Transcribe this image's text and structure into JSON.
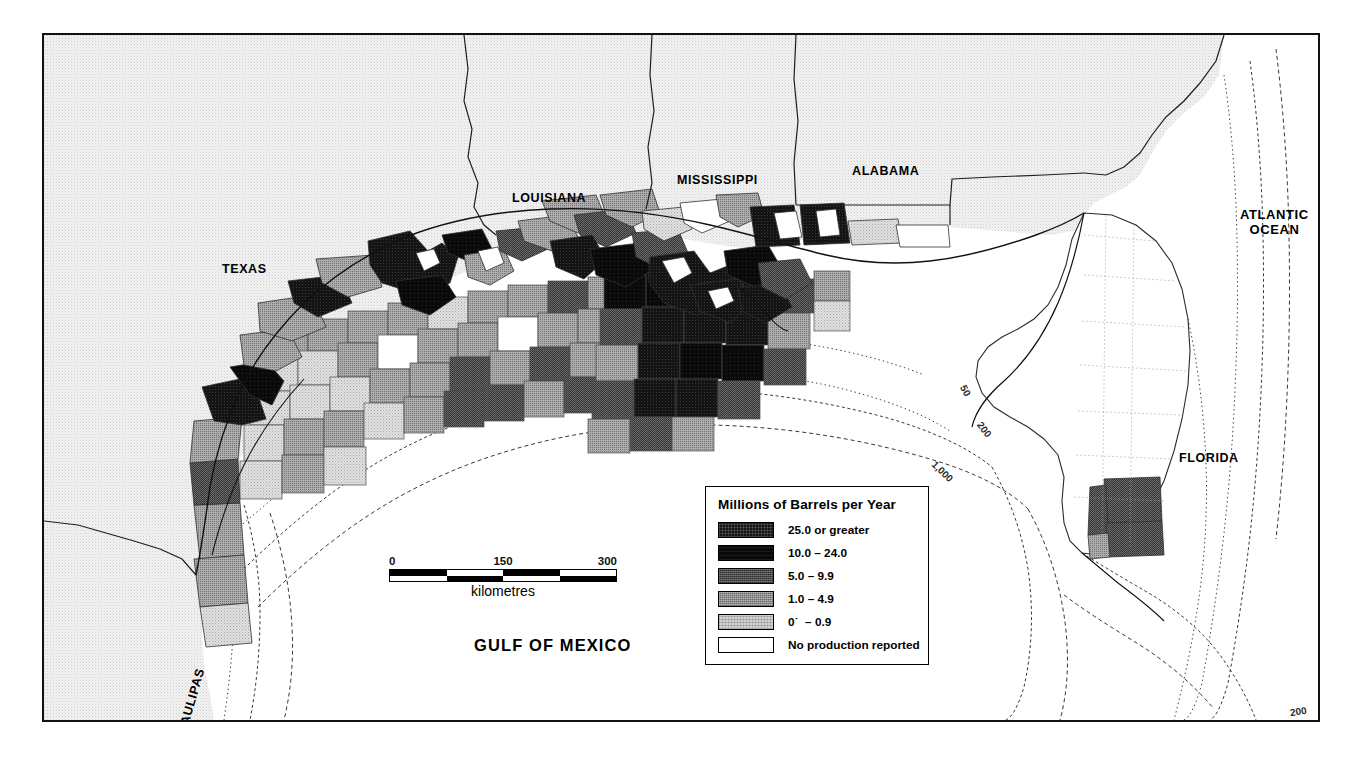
{
  "map": {
    "title_labels": {
      "gulf": "GULF OF MEXICO",
      "atlantic": "ATLANTIC\nOCEAN"
    },
    "state_labels": [
      {
        "name": "texas",
        "text": "TEXAS",
        "x": 178,
        "y": 227,
        "rot": 0
      },
      {
        "name": "louisiana",
        "text": "LOUISIANA",
        "x": 468,
        "y": 156,
        "rot": 0
      },
      {
        "name": "mississippi",
        "text": "MISSISSIPPI",
        "x": 633,
        "y": 138,
        "rot": 0
      },
      {
        "name": "alabama",
        "text": "ALABAMA",
        "x": 808,
        "y": 129,
        "rot": 0
      },
      {
        "name": "florida",
        "text": "FLORIDA",
        "x": 1135,
        "y": 416,
        "rot": 0
      },
      {
        "name": "tamaulipas",
        "text": "TAMAULIPAS",
        "x": 140,
        "y": 704,
        "rot": -74
      }
    ],
    "ocean_labels": [
      {
        "name": "atlantic-ocean",
        "text": "ATLANTIC\nOCEAN",
        "x": 1221,
        "y": 173
      },
      {
        "name": "gulf-of-mexico",
        "text": "GULF OF MEXICO",
        "x": 450,
        "y": 611
      }
    ],
    "contour_labels": [
      {
        "name": "contour-50-atlantic",
        "text": "50",
        "x": 1290,
        "y": 227,
        "rot": 80
      },
      {
        "name": "contour-50-gulf",
        "text": "50",
        "x": 921,
        "y": 353,
        "rot": 62
      },
      {
        "name": "contour-200-gulf",
        "text": "200",
        "x": 938,
        "y": 392,
        "rot": 52
      },
      {
        "name": "contour-1000-gulf",
        "text": "1,000",
        "x": 893,
        "y": 434,
        "rot": 44
      },
      {
        "name": "contour-200-florida",
        "text": "200",
        "x": 1253,
        "y": 674,
        "rot": -8
      }
    ]
  },
  "scalebar": {
    "name": "scale-bar",
    "ticks": [
      "0",
      "150",
      "300"
    ],
    "caption": "kilometres"
  },
  "legend": {
    "title": "Millions of Barrels per Year",
    "rows": [
      {
        "label": "25.0 or greater",
        "class": "fill-c1",
        "swatch_name": "legend-swatch-25-or-greater"
      },
      {
        "label": "10.0 – 24.0",
        "class": "fill-c2",
        "swatch_name": "legend-swatch-10-to-24"
      },
      {
        "label": "5.0 – 9.9",
        "class": "fill-c3",
        "swatch_name": "legend-swatch-5-to-9-9"
      },
      {
        "label": "1.0 – 4.9",
        "class": "fill-c4",
        "swatch_name": "legend-swatch-1-to-4-9"
      },
      {
        "label": "0˙  – 0.9",
        "class": "fill-c5",
        "swatch_name": "legend-swatch-0-to-0-9"
      },
      {
        "label": "No production reported",
        "class": "fill-c6",
        "swatch_name": "legend-swatch-no-production"
      }
    ]
  },
  "colors": {
    "class_25_plus": "#141414",
    "class_10_24": "#0a0a0a",
    "class_5_9": "#5b5b5b",
    "class_1_4": "#989898",
    "class_0_0_9": "#d2d2d2",
    "no_production": "#ffffff",
    "land_base": "#ebebeb",
    "frame": "#121212"
  }
}
